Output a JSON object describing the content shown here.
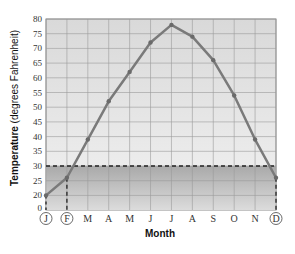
{
  "chart_data": {
    "type": "line",
    "title": "",
    "xlabel": "Month",
    "ylabel": "Temperature (degrees Fahrenheit)",
    "ylabel_bold_part": "Temperature",
    "ylabel_rest": " (degrees Fahrenheit)",
    "categories": [
      "J",
      "F",
      "M",
      "A",
      "M",
      "J",
      "J",
      "A",
      "S",
      "O",
      "N",
      "D"
    ],
    "circled_categories": [
      0,
      1,
      11
    ],
    "series": [
      {
        "name": "Temperature",
        "values": [
          20,
          26,
          39,
          52,
          62,
          72,
          78,
          74,
          66,
          54,
          39,
          26
        ],
        "color": "#7a7a7a"
      }
    ],
    "y_ticks": [
      0,
      20,
      25,
      30,
      35,
      40,
      45,
      50,
      55,
      60,
      65,
      70,
      75,
      80
    ],
    "ylim": [
      15,
      80
    ],
    "axis_break": "0 shown below 20",
    "threshold_line": {
      "value": 30,
      "style": "dashed",
      "color": "#222222"
    },
    "shaded_region": {
      "from": 0,
      "to": 30,
      "color": "#b8b8b8"
    },
    "vertical_dashed_markers": [
      "F",
      "D"
    ],
    "grid": true,
    "legend": null
  }
}
